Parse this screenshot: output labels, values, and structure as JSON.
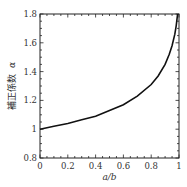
{
  "chart_data": {
    "type": "line",
    "title": "",
    "xlabel": "a/b",
    "ylabel": "補正係数 α",
    "ylabel_text": "補正係数",
    "ylabel_symbol": "α",
    "xlim": [
      0,
      1
    ],
    "ylim": [
      0.8,
      1.8
    ],
    "grid": false,
    "legend": null,
    "x_ticks": [
      0,
      0.2,
      0.4,
      0.6,
      0.8,
      1
    ],
    "x_tick_labels": [
      "0",
      "0.2",
      "0.4",
      "0.6",
      "0.8",
      "1"
    ],
    "y_ticks": [
      0.8,
      1.0,
      1.2,
      1.4,
      1.6,
      1.8
    ],
    "y_tick_labels": [
      "0.8",
      "1",
      "1.2",
      "1.4",
      "1.6",
      "1.8"
    ],
    "series": [
      {
        "name": "α",
        "color": "#111111",
        "x": [
          0,
          0.1,
          0.2,
          0.3,
          0.4,
          0.5,
          0.6,
          0.7,
          0.8,
          0.85,
          0.9,
          0.93,
          0.95,
          0.97,
          0.98,
          0.99
        ],
        "y": [
          1.0,
          1.02,
          1.04,
          1.065,
          1.09,
          1.13,
          1.17,
          1.23,
          1.31,
          1.37,
          1.45,
          1.52,
          1.58,
          1.66,
          1.72,
          1.8
        ]
      }
    ]
  }
}
